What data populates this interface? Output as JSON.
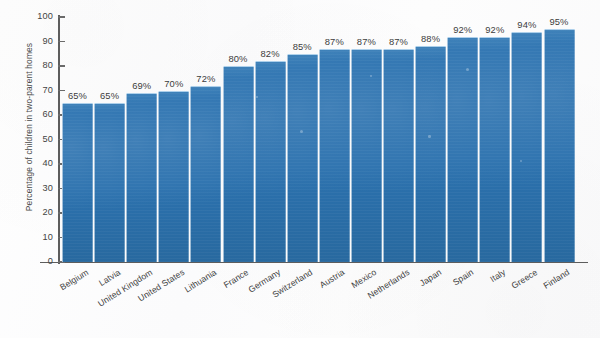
{
  "chart_data": {
    "type": "bar",
    "title": "",
    "subtitle": "",
    "xlabel": "",
    "ylabel": "Percentage of children in two-parent homes",
    "ylim": [
      0,
      100
    ],
    "yticks": [
      0,
      10,
      20,
      30,
      40,
      50,
      60,
      70,
      80,
      90,
      100
    ],
    "ytick_labels": [
      "0",
      "10",
      "20",
      "30",
      "40",
      "50",
      "60",
      "70",
      "80",
      "90",
      "100"
    ],
    "grid": false,
    "legend": null,
    "legend_position": "none",
    "bar_color": "#2b72b0",
    "value_label_suffix": "%",
    "categories": [
      "Belgium",
      "Latvia",
      "United Kingdom",
      "United States",
      "Lithuania",
      "France",
      "Germany",
      "Switzerland",
      "Austria",
      "Mexico",
      "Netherlands",
      "Japan",
      "Spain",
      "Italy",
      "Greece",
      "Finland"
    ],
    "values": [
      65,
      65,
      69,
      70,
      72,
      80,
      82,
      85,
      87,
      87,
      87,
      88,
      92,
      92,
      94,
      95
    ],
    "value_labels": [
      "65%",
      "65%",
      "69%",
      "70%",
      "72%",
      "80%",
      "82%",
      "85%",
      "87%",
      "87%",
      "87%",
      "88%",
      "92%",
      "92%",
      "94%",
      "95%"
    ]
  }
}
